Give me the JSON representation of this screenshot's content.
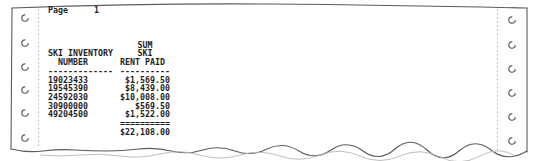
{
  "page": {
    "label": "Page",
    "number": "1"
  },
  "report": {
    "columns": [
      {
        "header_lines": [
          "SKI INVENTORY",
          "NUMBER"
        ],
        "underline": "-------------"
      },
      {
        "header_lines": [
          "SUM",
          "SKI",
          "RENT PAID"
        ],
        "underline": "----------"
      }
    ],
    "rows": [
      {
        "ski_inventory_number": "19023433",
        "sum_ski_rent_paid": "$1,569.50"
      },
      {
        "ski_inventory_number": "19545390",
        "sum_ski_rent_paid": "$8,439.00"
      },
      {
        "ski_inventory_number": "24592030",
        "sum_ski_rent_paid": "$10,008.00"
      },
      {
        "ski_inventory_number": "30900000",
        "sum_ski_rent_paid": "$569.50"
      },
      {
        "ski_inventory_number": "49204500",
        "sum_ski_rent_paid": "$1,522.00"
      }
    ],
    "total_separator": "==========",
    "total": "$22,108.00"
  },
  "paper": {
    "type": "continuous-form printout",
    "tractor_holes_per_side": 6,
    "ink_color": "#1f1f1f",
    "edge_color": "#5c5c5c"
  }
}
